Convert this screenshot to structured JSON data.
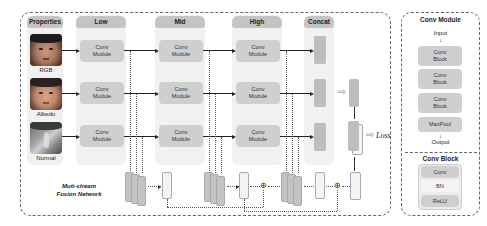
{
  "diagram": {
    "main_frame_caption": [
      "Muti-stream",
      "Fusion Network"
    ],
    "columns": [
      {
        "id": "properties",
        "label": "Properties"
      },
      {
        "id": "low",
        "label": "Low"
      },
      {
        "id": "mid",
        "label": "Mid"
      },
      {
        "id": "high",
        "label": "High"
      },
      {
        "id": "concat",
        "label": "Concat"
      }
    ],
    "inputs": [
      {
        "label": "RGB"
      },
      {
        "label": "Albedo"
      },
      {
        "label": "Normal"
      }
    ],
    "conv_module_label": [
      "Conv",
      "Module"
    ],
    "loss_label": "Loss",
    "conv_module_panel": {
      "title": "Conv Module",
      "input_label": "Input",
      "output_label": "Output",
      "blocks": [
        {
          "line1": "Conv",
          "line2": "Block"
        },
        {
          "line1": "Conv",
          "line2": "Block"
        },
        {
          "line1": "Conv",
          "line2": "Block"
        },
        {
          "line1": "MaxPool",
          "line2": ""
        }
      ]
    },
    "conv_block_panel": {
      "title": "Conv Block",
      "layers": [
        "Conv",
        "BN",
        "ReLU"
      ]
    },
    "fusion_symbol": "⊕",
    "hollow_arrow": "⇨"
  }
}
